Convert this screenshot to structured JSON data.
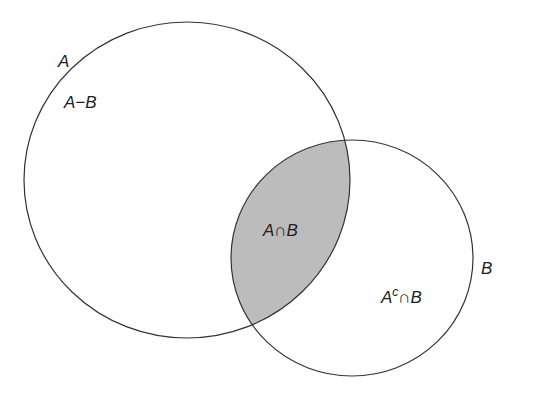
{
  "diagram": {
    "type": "venn",
    "colors": {
      "stroke": "#333333",
      "intersection_fill": "#bcbcbc",
      "background": "#ffffff",
      "text": "#222222"
    },
    "sets": [
      {
        "id": "A",
        "label": "A",
        "cx": 187,
        "cy": 180,
        "rx": 163,
        "ry": 158
      },
      {
        "id": "B",
        "label": "B",
        "cx": 352,
        "cy": 258,
        "rx": 121,
        "ry": 118
      }
    ],
    "regions": {
      "a_minus_b": {
        "label": "A−B"
      },
      "a_intersect_b": {
        "label": "A∩B",
        "shaded": true
      },
      "ac_intersect_b": {
        "label_base": "A",
        "label_sup": "c",
        "label_rest": "∩B"
      }
    }
  }
}
